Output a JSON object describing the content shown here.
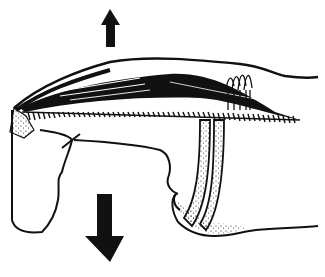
{
  "figure": {
    "type": "anatomical line illustration",
    "colors": {
      "ink": "#111111",
      "background": "#ffffff"
    },
    "arrows": [
      {
        "name": "up-arrow",
        "direction": "up"
      },
      {
        "name": "down-arrow",
        "direction": "down"
      }
    ],
    "caption": ""
  }
}
